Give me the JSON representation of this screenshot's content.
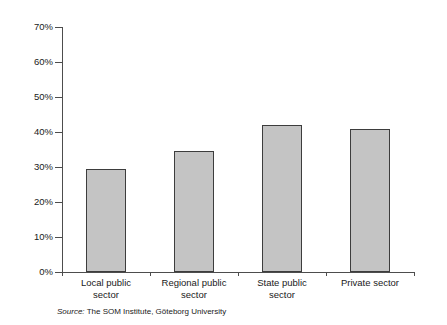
{
  "chart_data": {
    "type": "bar",
    "title": "",
    "subtitle": "",
    "xlabel": "",
    "ylabel": "",
    "categories": [
      "Local public sector",
      "Regional public sector",
      "State public sector",
      "Private sector"
    ],
    "category_lines": [
      [
        "Local public",
        "sector"
      ],
      [
        "Regional public",
        "sector"
      ],
      [
        "State public",
        "sector"
      ],
      [
        "Private sector"
      ]
    ],
    "values": [
      29.5,
      34.5,
      42.0,
      41.0
    ],
    "value_labels": [
      "",
      "",
      "",
      ""
    ],
    "ylim": [
      0,
      70
    ],
    "ytick_values": [
      0,
      10,
      20,
      30,
      40,
      50,
      60,
      70
    ],
    "ytick_labels": [
      "0%",
      "10%",
      "20%",
      "30%",
      "40%",
      "50%",
      "60%",
      "70%"
    ],
    "grid": false,
    "legend": null,
    "legend_position": "none",
    "bar_fill_color": "#c4c4c4",
    "bar_border_color": "#3d3d3d",
    "axis_color": "#4d4d4d"
  },
  "source_note": {
    "keyword": "Source:",
    "text": "The SOM Institute, Göteborg University"
  }
}
